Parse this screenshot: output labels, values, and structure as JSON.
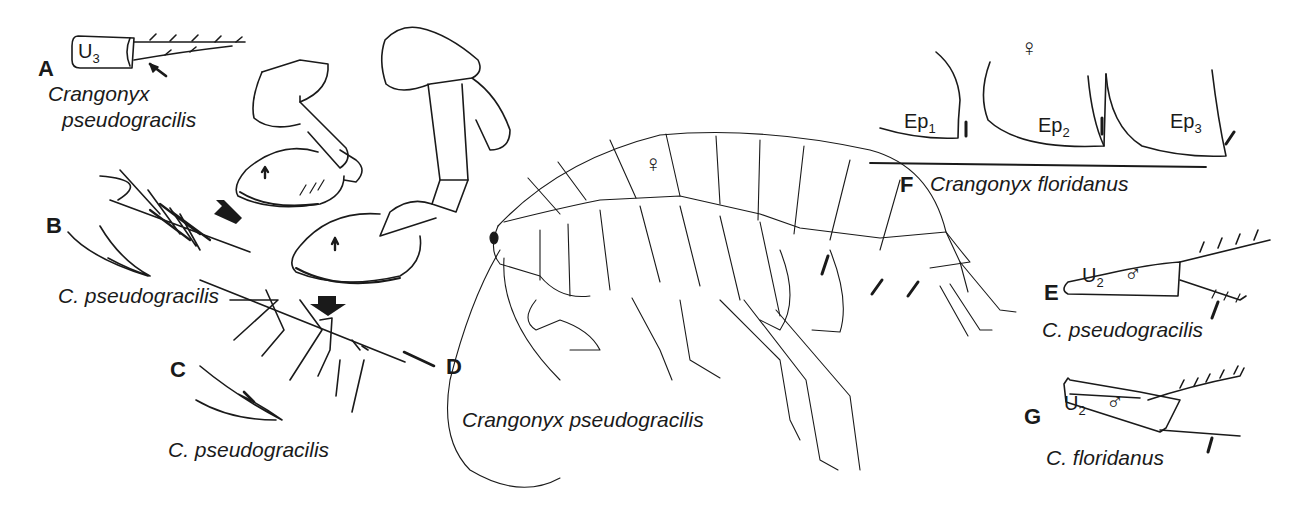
{
  "figure": {
    "panels": [
      {
        "letter": "A",
        "structure": "U",
        "structure_sub": "3",
        "species_line1": "Crangonyx",
        "species_line2": "pseudogracilis"
      },
      {
        "letter": "B",
        "species": "C. pseudogracilis"
      },
      {
        "letter": "C",
        "species": "C. pseudogracilis"
      },
      {
        "letter": "D",
        "sex": "♀",
        "species": "Crangonyx pseudogracilis"
      },
      {
        "letter": "E",
        "structure": "U",
        "structure_sub": "2",
        "sex": "♂",
        "species": "C. pseudogracilis"
      },
      {
        "letter": "F",
        "sex": "♀",
        "species": "Crangonyx floridanus",
        "epimera": [
          {
            "label": "Ep",
            "sub": "1"
          },
          {
            "label": "Ep",
            "sub": "2"
          },
          {
            "label": "Ep",
            "sub": "3"
          }
        ]
      },
      {
        "letter": "G",
        "structure": "U",
        "structure_sub": "2",
        "sex": "♂",
        "species": "C. floridanus"
      }
    ],
    "colors": {
      "ink": "#1a1a1a",
      "background": "#ffffff"
    }
  }
}
